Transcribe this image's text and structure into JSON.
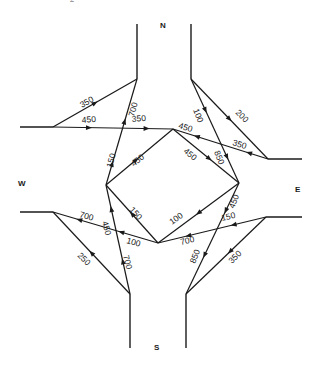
{
  "caption": "- - - 2",
  "directions": {
    "north": "N",
    "south": "S",
    "east": "E",
    "west": "W"
  },
  "flows": [
    {
      "id": "n-to-w",
      "label": "350",
      "from": "N",
      "to": "W",
      "direction": "toward-N"
    },
    {
      "id": "w-to-e-top",
      "label": "450",
      "from": "W",
      "to": "diamond-top"
    },
    {
      "id": "w-to-top-350",
      "label": "350",
      "from": "W",
      "to": "diamond-top"
    },
    {
      "id": "n-left-700",
      "label": "700",
      "from": "diamond-left",
      "to": "N"
    },
    {
      "id": "left-150",
      "label": "150",
      "from": "diamond-left",
      "to": "N"
    },
    {
      "id": "diamond-tl",
      "label": "450",
      "from": "diamond-left",
      "to": "diamond-top"
    },
    {
      "id": "diamond-tr",
      "label": "450",
      "from": "diamond-top",
      "to": "diamond-right"
    },
    {
      "id": "e-to-top-450",
      "label": "450",
      "from": "E",
      "to": "diamond-top"
    },
    {
      "id": "e-to-top-350",
      "label": "350",
      "from": "E",
      "to": "diamond-top"
    },
    {
      "id": "n-right-100",
      "label": "100",
      "from": "N",
      "to": "diamond-right"
    },
    {
      "id": "n-right-850",
      "label": "850",
      "from": "N",
      "to": "diamond-right"
    },
    {
      "id": "n-to-e",
      "label": "200",
      "from": "N",
      "to": "E"
    },
    {
      "id": "right-450",
      "label": "450",
      "from": "diamond-right",
      "to": "S"
    },
    {
      "id": "diamond-bl",
      "label": "150",
      "from": "diamond-bottom",
      "to": "diamond-left"
    },
    {
      "id": "diamond-br",
      "label": "100",
      "from": "diamond-right",
      "to": "diamond-bottom"
    },
    {
      "id": "e-to-bottom-150",
      "label": "150",
      "from": "E",
      "to": "diamond-bottom"
    },
    {
      "id": "e-to-bottom-700",
      "label": "700",
      "from": "E",
      "to": "diamond-bottom"
    },
    {
      "id": "right-850",
      "label": "850",
      "from": "diamond-right",
      "to": "S"
    },
    {
      "id": "e-to-s",
      "label": "350",
      "from": "E",
      "to": "S"
    },
    {
      "id": "bottom-to-w-700",
      "label": "700",
      "from": "diamond-bottom",
      "to": "W"
    },
    {
      "id": "bottom-to-w-100",
      "label": "100",
      "from": "diamond-bottom",
      "to": "W"
    },
    {
      "id": "left-450",
      "label": "450",
      "from": "S",
      "to": "diamond-left"
    },
    {
      "id": "s-700",
      "label": "700",
      "from": "S",
      "to": "diamond-left"
    },
    {
      "id": "s-to-w",
      "label": "250",
      "from": "S",
      "to": "W"
    }
  ]
}
